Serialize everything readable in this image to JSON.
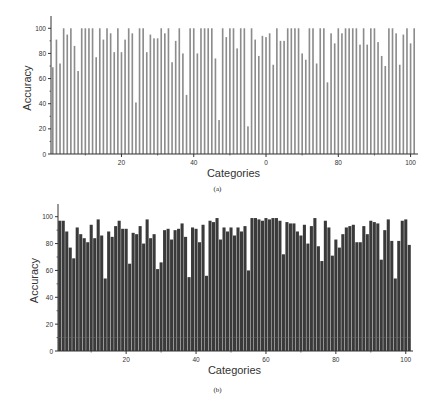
{
  "chart_data": [
    {
      "type": "bar",
      "panel": "(a)",
      "title": "",
      "xlabel": "Categories",
      "ylabel": "Accuracy",
      "ylim": [
        0,
        105
      ],
      "xlim": [
        0,
        101
      ],
      "xticks": [
        20,
        40,
        60,
        80,
        100
      ],
      "xtick_labels": [
        "20",
        "40",
        "0",
        "80",
        "100"
      ],
      "yticks": [
        0,
        20,
        40,
        60,
        80,
        100
      ],
      "grid": false,
      "bar_color": "#8c8c8c",
      "categories": [
        1,
        2,
        3,
        4,
        5,
        6,
        7,
        8,
        9,
        10,
        11,
        12,
        13,
        14,
        15,
        16,
        17,
        18,
        19,
        20,
        21,
        22,
        23,
        24,
        25,
        26,
        27,
        28,
        29,
        30,
        31,
        32,
        33,
        34,
        35,
        36,
        37,
        38,
        39,
        40,
        41,
        42,
        43,
        44,
        45,
        46,
        47,
        48,
        49,
        50,
        51,
        52,
        53,
        54,
        55,
        56,
        57,
        58,
        59,
        60,
        61,
        62,
        63,
        64,
        65,
        66,
        67,
        68,
        69,
        70,
        71,
        72,
        73,
        74,
        75,
        76,
        77,
        78,
        79,
        80,
        81,
        82,
        83,
        84,
        85,
        86,
        87,
        88,
        89,
        90,
        91,
        92,
        93,
        94,
        95,
        96,
        97,
        98,
        99,
        100,
        101
      ],
      "values": [
        69,
        91,
        72,
        100,
        95,
        100,
        86,
        66,
        100,
        100,
        100,
        100,
        77,
        100,
        91,
        100,
        96,
        81,
        100,
        81,
        91,
        100,
        96,
        41,
        100,
        100,
        81,
        95,
        92,
        92,
        100,
        96,
        100,
        73,
        90,
        100,
        80,
        47,
        100,
        100,
        80,
        100,
        100,
        100,
        100,
        76,
        27,
        100,
        93,
        100,
        100,
        84,
        100,
        100,
        22,
        100,
        91,
        78,
        94,
        93,
        96,
        71,
        100,
        90,
        90,
        100,
        100,
        100,
        100,
        80,
        75,
        100,
        100,
        72,
        100,
        100,
        57,
        96,
        88,
        100,
        96,
        100,
        100,
        100,
        100,
        87,
        100,
        87,
        100,
        100,
        89,
        78,
        70,
        100,
        100,
        96,
        71,
        95,
        100,
        88,
        100
      ]
    },
    {
      "type": "bar",
      "panel": "(b)",
      "title": "",
      "xlabel": "Categories",
      "ylabel": "Accuracy",
      "ylim": [
        0,
        105
      ],
      "xlim": [
        0,
        101
      ],
      "xticks": [
        20,
        40,
        60,
        80,
        100
      ],
      "xtick_labels": [
        "20",
        "40",
        "60",
        "80",
        "100"
      ],
      "yticks": [
        0,
        20,
        40,
        60,
        80,
        100
      ],
      "grid": false,
      "bar_color": "#3a3a3a",
      "categories": [
        1,
        2,
        3,
        4,
        5,
        6,
        7,
        8,
        9,
        10,
        11,
        12,
        13,
        14,
        15,
        16,
        17,
        18,
        19,
        20,
        21,
        22,
        23,
        24,
        25,
        26,
        27,
        28,
        29,
        30,
        31,
        32,
        33,
        34,
        35,
        36,
        37,
        38,
        39,
        40,
        41,
        42,
        43,
        44,
        45,
        46,
        47,
        48,
        49,
        50,
        51,
        52,
        53,
        54,
        55,
        56,
        57,
        58,
        59,
        60,
        61,
        62,
        63,
        64,
        65,
        66,
        67,
        68,
        69,
        70,
        71,
        72,
        73,
        74,
        75,
        76,
        77,
        78,
        79,
        80,
        81,
        82,
        83,
        84,
        85,
        86,
        87,
        88,
        89,
        90,
        91,
        92,
        93,
        94,
        95,
        96,
        97,
        98,
        99,
        100,
        101
      ],
      "values": [
        97,
        97,
        89,
        77,
        69,
        92,
        87,
        84,
        81,
        94,
        84,
        98,
        86,
        54,
        89,
        85,
        93,
        97,
        91,
        91,
        65,
        88,
        87,
        93,
        80,
        98,
        84,
        87,
        61,
        66,
        90,
        91,
        83,
        90,
        91,
        95,
        85,
        55,
        92,
        91,
        81,
        94,
        56,
        97,
        96,
        99,
        83,
        92,
        89,
        92,
        86,
        92,
        89,
        93,
        60,
        99,
        99,
        98,
        97,
        99,
        98,
        99,
        99,
        97,
        72,
        96,
        95,
        95,
        89,
        86,
        94,
        80,
        93,
        99,
        78,
        67,
        97,
        92,
        71,
        83,
        77,
        87,
        92,
        93,
        94,
        81,
        81,
        93,
        87,
        97,
        96,
        95,
        68,
        90,
        98,
        82,
        54,
        82,
        97,
        98,
        79
      ]
    }
  ],
  "figure": {
    "panels": [
      {
        "caption": "(a)",
        "xlabel": "Categories",
        "ylabel": "Accuracy"
      },
      {
        "caption": "(b)",
        "xlabel": "Categories",
        "ylabel": "Accuracy"
      }
    ]
  }
}
